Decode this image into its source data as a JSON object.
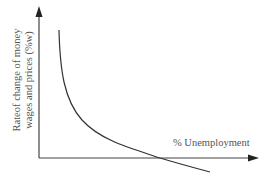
{
  "diagram": {
    "y_axis_label_line1": "Rateof change of money",
    "y_axis_label_line2": "wages and prices (%w)",
    "x_axis_label": "% Unemployment",
    "colors": {
      "axis": "#444444",
      "curve": "#333333",
      "text": "#555555"
    }
  }
}
